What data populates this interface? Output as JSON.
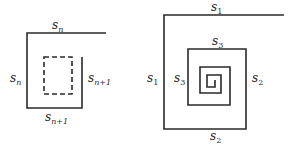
{
  "figure": {
    "left_panel": {
      "description": "Square with inner dashed square; sides labeled",
      "labels": {
        "top": {
          "base": "s",
          "sub": "n"
        },
        "left": {
          "base": "s",
          "sub": "n"
        },
        "right": {
          "base": "s",
          "sub": "n+1"
        },
        "bottom": {
          "base": "s",
          "sub": "n+1"
        }
      }
    },
    "right_panel": {
      "description": "Square spiral winding inward",
      "labels": {
        "top": {
          "base": "s",
          "sub": "1"
        },
        "left_outer": {
          "base": "s",
          "sub": "1"
        },
        "right_outer": {
          "base": "s",
          "sub": "2"
        },
        "bottom": {
          "base": "s",
          "sub": "2"
        },
        "inner_top": {
          "base": "s",
          "sub": "3"
        },
        "inner_left": {
          "base": "s",
          "sub": "3"
        }
      }
    },
    "colors": {
      "line": "#2a2a2a",
      "background": "#ffffff"
    }
  }
}
